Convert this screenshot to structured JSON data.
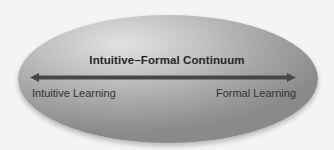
{
  "diagram": {
    "title": "Intuitive–Formal Continuum",
    "left_label": "Intuitive Learning",
    "right_label": "Formal Learning",
    "arrow": "double-headed",
    "colors": {
      "background": "#f4f4f2",
      "ellipse_light": "#e2e2e0",
      "ellipse_dark": "#8a8a88",
      "arrow": "#474747",
      "text": "#262626"
    }
  }
}
